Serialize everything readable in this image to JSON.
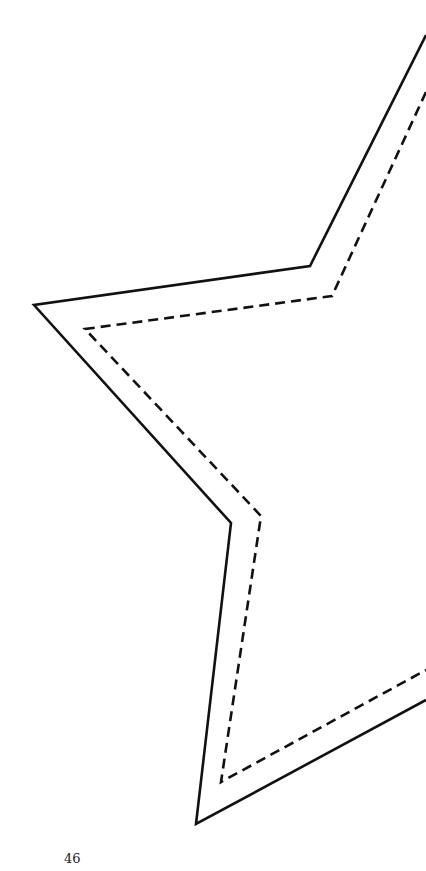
{
  "page": {
    "number": "46",
    "colors": {
      "line": "#111111",
      "background": "#ffffff"
    }
  },
  "shapes": {
    "solid_outline": "426,35 310,266 34,305 231,523 196,824 426,700",
    "dashed_outline": "426,92 332,296 85,329 261,516 221,782 426,670"
  }
}
